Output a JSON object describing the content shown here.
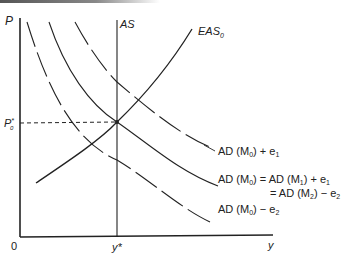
{
  "figure": {
    "axes": {
      "y_label": "P",
      "x_label": "y",
      "origin_label": "0",
      "x_tick_label": "y*",
      "y_tick_label_main": "P",
      "y_tick_label_sup": "*",
      "y_tick_label_sub": "0"
    },
    "curves": {
      "as_label": "AS",
      "eas_label_main": "EAS",
      "eas_label_sub": "0",
      "ad_upper": {
        "label_prefix": "AD (M",
        "label_sub": "0",
        "label_suffix": ") + e",
        "label_suffix_sub": "1",
        "style": "dashed"
      },
      "ad_middle": {
        "line1_prefix": "AD (M",
        "line1_sub": "0",
        "line1_mid": ") = AD (M",
        "line1_sub2": "1",
        "line1_suffix": ") + e",
        "line1_suffix_sub": "1",
        "line2_prefix": "= AD (M",
        "line2_sub": "2",
        "line2_suffix": ") − e",
        "line2_suffix_sub": "2",
        "style": "solid"
      },
      "ad_lower": {
        "label_prefix": "AD (M",
        "label_sub": "0",
        "label_suffix": ") − e",
        "label_suffix_sub": "2",
        "style": "dashed"
      }
    },
    "colors": {
      "line": "#222222",
      "background": "#ffffff"
    }
  }
}
